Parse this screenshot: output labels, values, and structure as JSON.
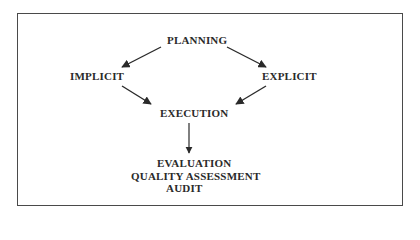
{
  "diagram": {
    "type": "flow",
    "nodes": {
      "planning": "PLANNING",
      "implicit": "IMPLICIT",
      "explicit": "EXPLICIT",
      "execution": "EXECUTION",
      "outcome": {
        "lines": [
          "EVALUATION",
          "QUALITY ASSESSMENT",
          "AUDIT"
        ]
      }
    },
    "edges": [
      {
        "from": "PLANNING",
        "to": "IMPLICIT"
      },
      {
        "from": "PLANNING",
        "to": "EXPLICIT"
      },
      {
        "from": "IMPLICIT",
        "to": "EXECUTION"
      },
      {
        "from": "EXPLICIT",
        "to": "EXECUTION"
      },
      {
        "from": "EXECUTION",
        "to": "EVALUATION / QUALITY ASSESSMENT / AUDIT"
      }
    ],
    "colors": {
      "border": "#4a4a4a",
      "text": "#2a2a2a",
      "arrow": "#2a2a2a",
      "background": "#ffffff"
    }
  }
}
